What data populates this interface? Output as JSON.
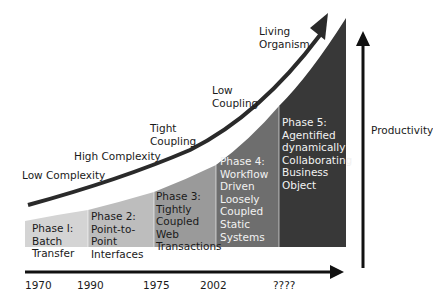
{
  "diagram": {
    "curve_labels": [
      {
        "id": "low-complexity",
        "text": "Low Complexity"
      },
      {
        "id": "high-complexity",
        "text": "High Complexity"
      },
      {
        "id": "tight-coupling",
        "lines": [
          "Tight",
          "Coupling"
        ]
      },
      {
        "id": "low-coupling",
        "lines": [
          "Low",
          "Coupling"
        ]
      },
      {
        "id": "living-organism",
        "lines": [
          "Living",
          "Organism"
        ]
      }
    ],
    "phases": [
      {
        "name": "Phase 1",
        "lines": [
          "Phase I:",
          "Batch",
          "Transfer"
        ],
        "color": "#d4d4d4",
        "text_color": "#1a1a1a"
      },
      {
        "name": "Phase 2",
        "lines": [
          "Phase 2:",
          "Point-to-",
          "Point",
          "Interfaces"
        ],
        "color": "#bdbdbd",
        "text_color": "#1a1a1a"
      },
      {
        "name": "Phase 3",
        "lines": [
          "Phase 3:",
          "Tightly",
          "Coupled",
          "Web",
          "Transactions"
        ],
        "color": "#9a9a9a",
        "text_color": "#1a1a1a"
      },
      {
        "name": "Phase 4",
        "lines": [
          "Phase 4:",
          "Workflow",
          "Driven",
          "Loosely",
          "Coupled",
          "Static",
          "Systems"
        ],
        "color": "#6e6e6e",
        "text_color": "#f2f2f2"
      },
      {
        "name": "Phase 5",
        "lines": [
          "Phase 5:",
          "Agentified",
          "dynamically",
          "Collaborating",
          "Business",
          "Object"
        ],
        "color": "#383838",
        "text_color": "#f2f2f2"
      }
    ],
    "timeline": {
      "years": [
        "1970",
        "1990",
        "1975",
        "2002",
        "????"
      ]
    },
    "y_axis": {
      "label": "Productivity"
    }
  }
}
